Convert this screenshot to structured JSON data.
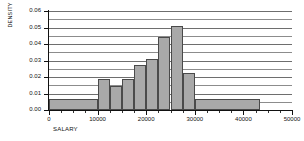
{
  "chart_data": {
    "type": "bar",
    "title": "",
    "xlabel": "SALARY",
    "ylabel": "DENSITY",
    "xlim": [
      0,
      50000
    ],
    "ylim": [
      0,
      0.06
    ],
    "grid": true,
    "legend": false,
    "yticks": [
      "0.00",
      "0.01",
      "0.02",
      "0.03",
      "0.04",
      "0.05",
      "0.06"
    ],
    "ytick_values": [
      0,
      0.01,
      0.02,
      0.03,
      0.04,
      0.05,
      0.06
    ],
    "gridline_values": [
      0.005,
      0.01,
      0.015,
      0.02,
      0.025,
      0.03,
      0.035,
      0.04,
      0.045,
      0.05,
      0.055,
      0.06
    ],
    "xticks": [
      "0",
      "10000",
      "20000",
      "30000",
      "40000",
      "50000"
    ],
    "xtick_values": [
      0,
      10000,
      20000,
      30000,
      40000,
      50000
    ],
    "xtick_minor_values": [
      2500,
      5000,
      7500,
      12500,
      15000,
      17500,
      22500,
      25000,
      27500,
      32500,
      35000,
      37500,
      42500,
      45000,
      47500
    ],
    "bins": [
      {
        "label": "0-10000",
        "x0": 0,
        "x1": 10000,
        "value": 0.0065
      },
      {
        "label": "10000-12500",
        "x0": 10000,
        "x1": 12500,
        "value": 0.0185
      },
      {
        "label": "12500-15000",
        "x0": 12500,
        "x1": 15000,
        "value": 0.0148
      },
      {
        "label": "15000-17500",
        "x0": 15000,
        "x1": 17500,
        "value": 0.0188
      },
      {
        "label": "17500-20000",
        "x0": 17500,
        "x1": 20000,
        "value": 0.0275
      },
      {
        "label": "20000-22500",
        "x0": 20000,
        "x1": 22500,
        "value": 0.0312
      },
      {
        "label": "22500-25000",
        "x0": 22500,
        "x1": 25000,
        "value": 0.044
      },
      {
        "label": "25000-27500",
        "x0": 25000,
        "x1": 27500,
        "value": 0.0508
      },
      {
        "label": "27500-30000",
        "x0": 27500,
        "x1": 30000,
        "value": 0.0225
      },
      {
        "label": "30000-43500",
        "x0": 30000,
        "x1": 43500,
        "value": 0.0065
      }
    ],
    "colors": {
      "bar_fill": "#a9a9a9",
      "bar_border": "#4a4a4a",
      "gridline": "#6e6e6e",
      "axis": "#111111",
      "background": "#ffffff"
    }
  }
}
